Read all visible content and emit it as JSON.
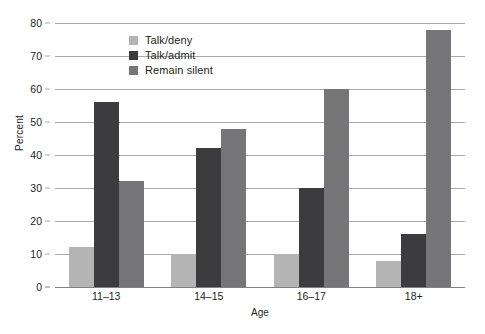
{
  "chart_data": {
    "type": "bar",
    "title": "",
    "xlabel": "Age",
    "ylabel": "Percent",
    "categories": [
      "11–13",
      "14–15",
      "16–17",
      "18+"
    ],
    "series": [
      {
        "name": "Talk/deny",
        "color": "#b4b4b4",
        "values": [
          12,
          10,
          10,
          8
        ]
      },
      {
        "name": "Talk/admit",
        "color": "#3c3c3e",
        "values": [
          56,
          42,
          30,
          16
        ]
      },
      {
        "name": "Remain silent",
        "color": "#767678",
        "values": [
          32,
          48,
          60,
          78
        ]
      }
    ],
    "ylim": [
      0,
      80
    ],
    "yticks": [
      0,
      10,
      20,
      30,
      40,
      50,
      60,
      70,
      80
    ],
    "ytick_labels": [
      "0",
      "10",
      "20",
      "30",
      "40",
      "50",
      "60",
      "70",
      "80"
    ],
    "grid": true,
    "legend_position": "top-center-inside",
    "gridline_color": "#a7a9ac",
    "axis_color": "#808285",
    "background": "#ffffff"
  }
}
